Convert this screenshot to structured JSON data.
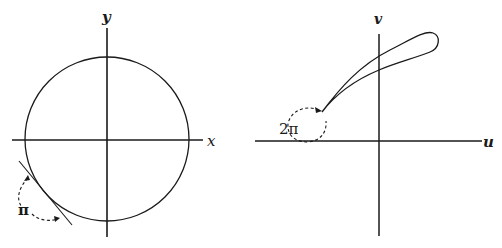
{
  "figures": [
    {
      "id": "z-plane",
      "axes": {
        "horizontal_label": "x",
        "vertical_label": "y"
      },
      "curve": "circle",
      "annotation": {
        "label": "π",
        "description": "dashed arrow showing tangent rotation"
      }
    },
    {
      "id": "w-plane",
      "axes": {
        "horizontal_label": "u",
        "vertical_label": "v"
      },
      "curve": "loop",
      "annotation": {
        "label": "2π",
        "description": "dashed circular arrow at cusp"
      }
    }
  ],
  "colors": {
    "ink": "#1a1a1a",
    "background": "#ffffff"
  }
}
